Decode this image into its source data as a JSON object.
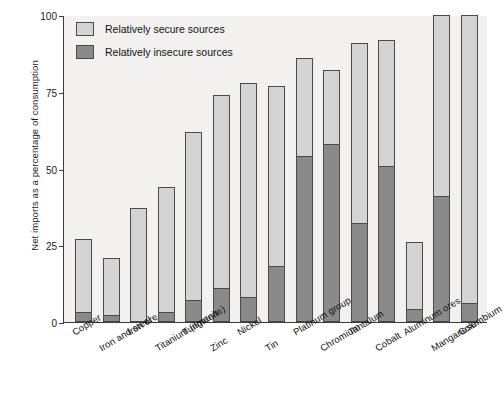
{
  "chart_data": {
    "type": "bar",
    "subtype": "stacked-vertical",
    "title": "",
    "xlabel": "",
    "ylabel": "Net imports as a percentage of consumption",
    "ylim": [
      0,
      100
    ],
    "yticks": [
      0,
      25,
      50,
      75,
      100
    ],
    "ytick_labels": [
      "0",
      "25",
      "50",
      "75",
      "100"
    ],
    "grid": false,
    "legend_position": "top-left",
    "categories": [
      "Copper",
      "Iron and steel",
      "Iron ore",
      "Titanium (ilmenite)",
      "Tungsten",
      "Zinc",
      "Nickel",
      "Tin",
      "Platinum group",
      "Chromium",
      "Tantalum",
      "Cobalt",
      "Aluminum ores",
      "Manganese",
      "Columbium"
    ],
    "series": [
      {
        "name": "Relatively insecure sources",
        "color": "#8a8a8a",
        "values": [
          3,
          2,
          0,
          3,
          7,
          11,
          8,
          18,
          54,
          58,
          32,
          51,
          4,
          41,
          6
        ]
      },
      {
        "name": "Relatively secure sources",
        "color": "#d4d4d4",
        "values": [
          24,
          19,
          37,
          41,
          55,
          63,
          70,
          59,
          32,
          24,
          59,
          41,
          22,
          59,
          94
        ]
      }
    ],
    "totals": [
      27,
      21,
      37,
      44,
      62,
      74,
      78,
      77,
      86,
      82,
      91,
      92,
      26,
      100,
      100
    ]
  },
  "legend": {
    "items": [
      {
        "label": "Relatively secure sources",
        "swatch": "secure"
      },
      {
        "label": "Relatively insecure sources",
        "swatch": "insecure"
      }
    ]
  },
  "colors": {
    "secure": "#d4d4d4",
    "insecure": "#8a8a8a",
    "axis": "#3b3b3b",
    "plot_background": "#f2f1ef",
    "bar_border": "#4a4a4a"
  }
}
